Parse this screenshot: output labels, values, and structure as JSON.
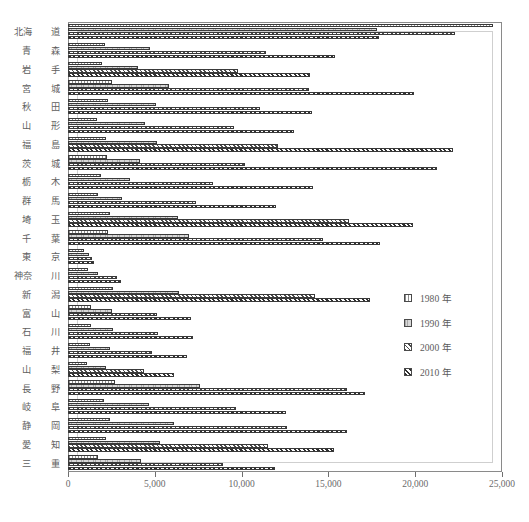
{
  "chart_data": {
    "type": "bar",
    "orientation": "horizontal",
    "title": "",
    "subtitle": "",
    "xlabel": "",
    "ylabel": "",
    "xlim": [
      0,
      25000
    ],
    "xticks": [
      0,
      5000,
      10000,
      15000,
      20000,
      25000
    ],
    "xticklabels": [
      "0",
      "5,000",
      "10,000",
      "15,000",
      "20,000",
      "25,000"
    ],
    "grid": false,
    "legend_position": "right-middle",
    "categories": [
      "北海道",
      "青森",
      "岩手",
      "宮城",
      "秋田",
      "山形",
      "福島",
      "茨城",
      "栃木",
      "群馬",
      "埼玉",
      "千葉",
      "東京",
      "神奈川",
      "新潟",
      "富山",
      "石川",
      "福井",
      "山梨",
      "長野",
      "岐阜",
      "静岡",
      "愛知",
      "三重"
    ],
    "category_parts": [
      [
        "北海",
        "道"
      ],
      [
        "青",
        "森"
      ],
      [
        "岩",
        "手"
      ],
      [
        "宮",
        "城"
      ],
      [
        "秋",
        "田"
      ],
      [
        "山",
        "形"
      ],
      [
        "福",
        "島"
      ],
      [
        "茨",
        "城"
      ],
      [
        "栃",
        "木"
      ],
      [
        "群",
        "馬"
      ],
      [
        "埼",
        "玉"
      ],
      [
        "千",
        "葉"
      ],
      [
        "東",
        "京"
      ],
      [
        "神奈",
        "川"
      ],
      [
        "新",
        "潟"
      ],
      [
        "富",
        "山"
      ],
      [
        "石",
        "川"
      ],
      [
        "福",
        "井"
      ],
      [
        "山",
        "梨"
      ],
      [
        "長",
        "野"
      ],
      [
        "岐",
        "阜"
      ],
      [
        "静",
        "岡"
      ],
      [
        "愛",
        "知"
      ],
      [
        "三",
        "重"
      ]
    ],
    "series": [
      {
        "name": "1980 年",
        "year": "1980",
        "pattern": "dotted-light",
        "values": [
          24500,
          2150,
          1950,
          2550,
          2300,
          1650,
          2200,
          2250,
          1900,
          1750,
          2400,
          2300,
          950,
          1150,
          2600,
          1300,
          1350,
          1250,
          1100,
          2700,
          2100,
          2400,
          2200,
          1700
        ]
      },
      {
        "name": "1990 年",
        "year": "1990",
        "pattern": "solid-light-grey",
        "values": [
          17800,
          4700,
          4050,
          5800,
          5050,
          4450,
          5100,
          4150,
          3600,
          3100,
          6350,
          6950,
          1200,
          1750,
          6400,
          2550,
          2600,
          2400,
          2200,
          7600,
          4650,
          6100,
          5300,
          4200
        ]
      },
      {
        "name": "2000 年",
        "year": "2000",
        "pattern": "diagonal-hatch",
        "values": [
          22300,
          11400,
          9800,
          13900,
          11050,
          9550,
          12100,
          10200,
          8350,
          7400,
          16200,
          14700,
          1400,
          2800,
          14250,
          5150,
          5200,
          4850,
          4400,
          16100,
          9700,
          12600,
          11500,
          8950
        ]
      },
      {
        "name": "2010 年",
        "year": "2010",
        "pattern": "diagonal-hatch-dark",
        "values": [
          17900,
          15400,
          13950,
          19950,
          14050,
          13000,
          22150,
          21250,
          14100,
          12000,
          19900,
          18000,
          1500,
          3050,
          17400,
          7100,
          7200,
          6850,
          6100,
          17100,
          12550,
          16100,
          15300,
          11900
        ]
      }
    ]
  },
  "legend": {
    "items": [
      {
        "label": "1980 年",
        "pattern": "dotted-light"
      },
      {
        "label": "1990 年",
        "pattern": "solid-light-grey"
      },
      {
        "label": "2000 年",
        "pattern": "diagonal-hatch"
      },
      {
        "label": "2010 年",
        "pattern": "diagonal-hatch-dark"
      }
    ]
  }
}
